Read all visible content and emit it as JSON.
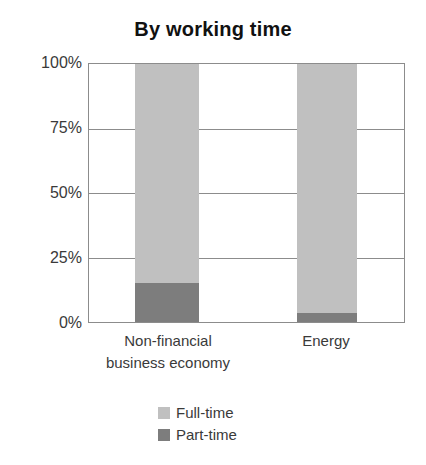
{
  "chart_data": {
    "type": "bar",
    "subtype": "stacked-percentage",
    "title": "By working time",
    "xlabel": "",
    "ylabel": "",
    "categories": [
      "Non-financial business economy",
      "Energy"
    ],
    "category_label_lines": [
      [
        "Non-financial",
        "business economy"
      ],
      [
        "Energy"
      ]
    ],
    "series": [
      {
        "name": "Full-time",
        "values": [
          85,
          96.5
        ],
        "color": "#c0c0c0"
      },
      {
        "name": "Part-time",
        "values": [
          15,
          3.5
        ],
        "color": "#7d7d7d"
      }
    ],
    "stack_order_bottom_to_top": [
      "Part-time",
      "Full-time"
    ],
    "ylim": [
      0,
      100
    ],
    "y_ticks": [
      0,
      25,
      50,
      75,
      100
    ],
    "y_tick_labels": [
      "0%",
      "25%",
      "50%",
      "75%",
      "100%"
    ],
    "grid": true,
    "grid_axis": "y",
    "legend_position": "bottom-center",
    "units": "percent"
  },
  "axis": {
    "y_tick_labels": [
      "100%",
      "75%",
      "50%",
      "25%",
      "0%"
    ]
  },
  "legend": {
    "items": [
      {
        "label": "Full-time",
        "color": "#c0c0c0"
      },
      {
        "label": "Part-time",
        "color": "#7d7d7d"
      }
    ]
  },
  "colors": {
    "full_time": "#c0c0c0",
    "part_time": "#7d7d7d",
    "axis_line": "#8c8c8c",
    "title_text": "#111111",
    "label_text": "#3a3a3a",
    "background": "#ffffff"
  }
}
